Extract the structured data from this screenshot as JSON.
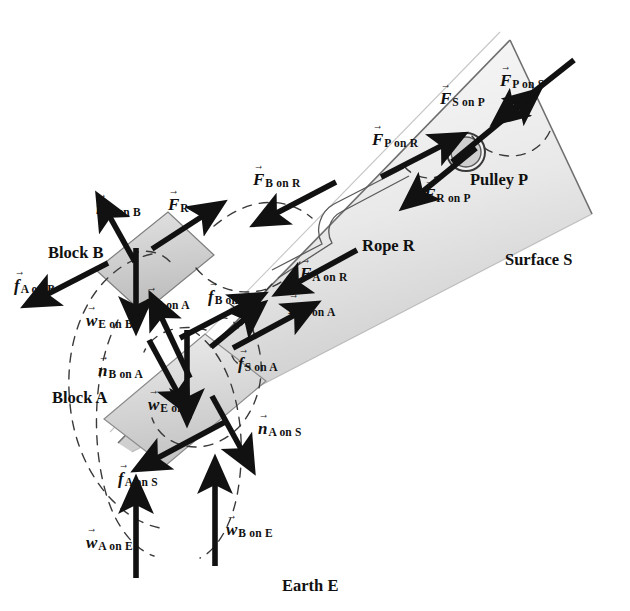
{
  "figure": {
    "background_color": "#ffffff",
    "ink_color": "#111111",
    "block_fill": "#c9c9c9",
    "block_fill_light": "#dcdcdc",
    "surface_fill": "#d8d8d8",
    "dashed_color": "#3a3a3a"
  },
  "objects": [
    {
      "id": "block-b",
      "label": "Block B",
      "x": 48,
      "y": 245
    },
    {
      "id": "block-a",
      "label": "Block A",
      "x": 52,
      "y": 390
    },
    {
      "id": "rope-r",
      "label": "Rope R",
      "x": 362,
      "y": 238
    },
    {
      "id": "pulley-p",
      "label": "Pulley P",
      "x": 470,
      "y": 172
    },
    {
      "id": "surface-s",
      "label": "Surface S",
      "x": 505,
      "y": 252
    },
    {
      "id": "earth-e",
      "label": "Earth E",
      "x": 282,
      "y": 578
    }
  ],
  "force_labels": [
    {
      "id": "n-a-on-b",
      "symbol": "n",
      "sub": "A on B",
      "x": 96,
      "y": 200
    },
    {
      "id": "f-r-on-b",
      "symbol": "F",
      "sub": "R on B",
      "x": 168,
      "y": 196
    },
    {
      "id": "f-b-on-r",
      "symbol": "F",
      "sub": "B on R",
      "x": 253,
      "y": 171
    },
    {
      "id": "f-p-on-r",
      "symbol": "F",
      "sub": "P on R",
      "x": 372,
      "y": 131
    },
    {
      "id": "f-s-on-p",
      "symbol": "F",
      "sub": "S on P",
      "x": 440,
      "y": 90
    },
    {
      "id": "f-p-on-s",
      "symbol": "F",
      "sub": "P on S",
      "x": 500,
      "y": 72
    },
    {
      "id": "f-r-on-p",
      "symbol": "F",
      "sub": "R on P",
      "x": 424,
      "y": 186
    },
    {
      "id": "f-a-on-r",
      "symbol": "F",
      "sub": "A on R",
      "x": 300,
      "y": 265
    },
    {
      "id": "f-r-on-a",
      "symbol": "F",
      "sub": "R on A",
      "x": 288,
      "y": 300
    },
    {
      "id": "f-a-on-b",
      "symbol": "f",
      "sub": "A on B",
      "x": 14,
      "y": 277
    },
    {
      "id": "w-e-on-b-upper",
      "symbol": "w",
      "sub": "E on B",
      "x": 86,
      "y": 312
    },
    {
      "id": "n-s-on-a",
      "symbol": "n",
      "sub": "S on A",
      "x": 146,
      "y": 293
    },
    {
      "id": "f-b-on-a",
      "symbol": "f",
      "sub": "B on A",
      "x": 208,
      "y": 288
    },
    {
      "id": "n-b-on-a",
      "symbol": "n",
      "sub": "B on A",
      "x": 98,
      "y": 362
    },
    {
      "id": "f-s-on-a",
      "symbol": "f",
      "sub": "S on A",
      "x": 238,
      "y": 355
    },
    {
      "id": "w-e-on-b-lower",
      "symbol": "w",
      "sub": "E on B",
      "x": 148,
      "y": 396
    },
    {
      "id": "n-a-on-s",
      "symbol": "n",
      "sub": "A on S",
      "x": 258,
      "y": 420
    },
    {
      "id": "f-a-on-s",
      "symbol": "f",
      "sub": "A on S",
      "x": 118,
      "y": 470
    },
    {
      "id": "w-a-on-e",
      "symbol": "w",
      "sub": "A on E",
      "x": 86,
      "y": 534
    },
    {
      "id": "w-b-on-e",
      "symbol": "w",
      "sub": "B on E",
      "x": 226,
      "y": 521
    }
  ],
  "vectors": [
    {
      "id": "vec-n-a-on-b",
      "x1": 135,
      "y1": 260,
      "x2": 105,
      "y2": 207
    },
    {
      "id": "vec-f-r-on-b",
      "x1": 155,
      "y1": 247,
      "x2": 210,
      "y2": 211
    },
    {
      "id": "vec-f-b-on-r",
      "x1": 335,
      "y1": 183,
      "x2": 268,
      "y2": 217
    },
    {
      "id": "vec-f-p-on-r",
      "x1": 382,
      "y1": 176,
      "x2": 448,
      "y2": 143
    },
    {
      "id": "vec-f-s-on-p",
      "x1": 455,
      "y1": 160,
      "x2": 524,
      "y2": 103
    },
    {
      "id": "vec-f-p-on-s",
      "x1": 572,
      "y1": 61,
      "x2": 508,
      "y2": 112
    },
    {
      "id": "vec-f-r-on-p",
      "x1": 474,
      "y1": 150,
      "x2": 417,
      "y2": 196
    },
    {
      "id": "vec-f-a-on-r",
      "x1": 358,
      "y1": 251,
      "x2": 292,
      "y2": 285
    },
    {
      "id": "vec-f-r-on-a",
      "x1": 235,
      "y1": 346,
      "x2": 300,
      "y2": 312
    },
    {
      "id": "vec-f-a-on-b",
      "x1": 105,
      "y1": 262,
      "x2": 38,
      "y2": 296
    },
    {
      "id": "vec-w-e-on-b-upper",
      "x1": 136,
      "y1": 247,
      "x2": 136,
      "y2": 312
    },
    {
      "id": "vec-n-s-on-a",
      "x1": 190,
      "y1": 375,
      "x2": 158,
      "y2": 311
    },
    {
      "id": "vec-f-b-on-a",
      "x1": 182,
      "y1": 337,
      "x2": 248,
      "y2": 303
    },
    {
      "id": "vec-n-b-on-a",
      "x1": 150,
      "y1": 341,
      "x2": 180,
      "y2": 398
    },
    {
      "id": "vec-f-s-on-a",
      "x1": 215,
      "y1": 345,
      "x2": 248,
      "y2": 316
    },
    {
      "id": "vec-w-e-on-b-lower",
      "x1": 187,
      "y1": 332,
      "x2": 187,
      "y2": 404
    },
    {
      "id": "vec-n-a-on-s",
      "x1": 213,
      "y1": 397,
      "x2": 244,
      "y2": 455
    },
    {
      "id": "vec-f-a-on-s",
      "x1": 223,
      "y1": 423,
      "x2": 152,
      "y2": 461
    },
    {
      "id": "vec-w-a-on-e",
      "x1": 136,
      "y1": 576,
      "x2": 136,
      "y2": 498
    },
    {
      "id": "vec-w-b-on-e",
      "x1": 215,
      "y1": 564,
      "x2": 215,
      "y2": 478
    }
  ],
  "interaction_pairs": [
    {
      "id": "pair-a-b",
      "between": [
        "Block A",
        "Block B"
      ]
    },
    {
      "id": "pair-b-r",
      "between": [
        "Block B",
        "Rope R"
      ]
    },
    {
      "id": "pair-r-p",
      "between": [
        "Rope R",
        "Pulley P"
      ]
    },
    {
      "id": "pair-p-s",
      "between": [
        "Pulley P",
        "Surface S"
      ]
    },
    {
      "id": "pair-a-r",
      "between": [
        "Block A",
        "Rope R"
      ]
    },
    {
      "id": "pair-a-s",
      "between": [
        "Block A",
        "Surface S"
      ]
    },
    {
      "id": "pair-a-e",
      "between": [
        "Block A",
        "Earth E"
      ]
    },
    {
      "id": "pair-b-e",
      "between": [
        "Block B",
        "Earth E"
      ]
    }
  ]
}
